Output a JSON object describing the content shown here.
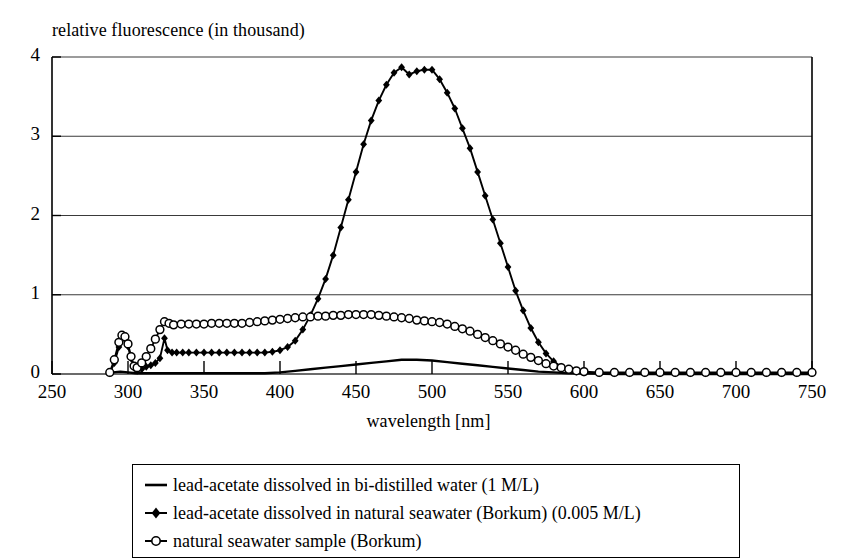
{
  "chart_data": {
    "type": "line",
    "title": "relative fluorescence (in thousand)",
    "xlabel": "wavelength [nm]",
    "ylabel": "relative fluorescence (in thousand)",
    "xlim": [
      250,
      750
    ],
    "ylim": [
      0,
      4
    ],
    "xticks": [
      250,
      300,
      350,
      400,
      450,
      500,
      550,
      600,
      650,
      700,
      750
    ],
    "yticks": [
      0,
      1,
      2,
      3,
      4
    ],
    "grid": "horizontal",
    "legend_position": "below-plot",
    "series": [
      {
        "name": "lead-acetate dissolved in bi-distilled water (1 M/L)",
        "marker": "none",
        "color": "#000000",
        "x": [
          290,
          295,
          300,
          305,
          310,
          320,
          330,
          340,
          350,
          360,
          370,
          380,
          390,
          400,
          410,
          420,
          430,
          440,
          450,
          460,
          470,
          480,
          490,
          500,
          510,
          520,
          530,
          540,
          550,
          560,
          570,
          580,
          590,
          600,
          620,
          640,
          660,
          680,
          700,
          720,
          740,
          750
        ],
        "y": [
          0.02,
          0.03,
          0.02,
          0.01,
          0.01,
          0.01,
          0.01,
          0.01,
          0.01,
          0.01,
          0.01,
          0.01,
          0.01,
          0.02,
          0.04,
          0.06,
          0.08,
          0.1,
          0.12,
          0.14,
          0.16,
          0.18,
          0.18,
          0.17,
          0.15,
          0.13,
          0.11,
          0.09,
          0.07,
          0.05,
          0.03,
          0.02,
          0.01,
          0.01,
          0.0,
          0.0,
          0.0,
          0.0,
          0.0,
          0.0,
          0.0,
          0.0
        ]
      },
      {
        "name": "lead-acetate dissolved in natural seawater (Borkum) (0.005 M/L)",
        "marker": "diamond",
        "color": "#000000",
        "x": [
          288,
          291,
          294,
          296,
          298,
          300,
          302,
          304,
          306,
          309,
          312,
          315,
          318,
          321,
          324,
          326,
          329,
          332,
          336,
          340,
          345,
          350,
          355,
          360,
          365,
          370,
          375,
          380,
          385,
          390,
          395,
          400,
          405,
          410,
          415,
          420,
          425,
          430,
          435,
          440,
          445,
          450,
          455,
          460,
          465,
          470,
          475,
          480,
          485,
          490,
          495,
          500,
          505,
          510,
          515,
          520,
          525,
          530,
          535,
          540,
          545,
          550,
          555,
          560,
          565,
          570,
          575,
          580,
          585,
          590,
          595,
          600,
          610,
          620,
          630,
          640,
          650,
          660,
          670,
          680,
          690,
          700,
          710,
          720,
          730,
          740,
          750
        ],
        "y": [
          0.01,
          0.14,
          0.34,
          0.45,
          0.44,
          0.35,
          0.2,
          0.08,
          0.04,
          0.06,
          0.09,
          0.11,
          0.14,
          0.2,
          0.45,
          0.3,
          0.27,
          0.27,
          0.27,
          0.27,
          0.27,
          0.27,
          0.27,
          0.27,
          0.27,
          0.27,
          0.27,
          0.27,
          0.27,
          0.27,
          0.28,
          0.3,
          0.34,
          0.42,
          0.56,
          0.74,
          0.95,
          1.2,
          1.5,
          1.85,
          2.2,
          2.55,
          2.9,
          3.2,
          3.45,
          3.65,
          3.8,
          3.87,
          3.78,
          3.82,
          3.84,
          3.84,
          3.72,
          3.55,
          3.35,
          3.1,
          2.85,
          2.55,
          2.25,
          1.95,
          1.65,
          1.35,
          1.05,
          0.8,
          0.58,
          0.4,
          0.26,
          0.16,
          0.09,
          0.05,
          0.03,
          0.02,
          0.01,
          0.01,
          0.01,
          0.01,
          0.01,
          0.01,
          0.01,
          0.01,
          0.01,
          0.01,
          0.01,
          0.01,
          0.01,
          0.01,
          0.01
        ]
      },
      {
        "name": "natural seawater sample (Borkum)",
        "marker": "circle",
        "color": "#000000",
        "x": [
          288,
          291,
          294,
          296,
          298,
          300,
          302,
          304,
          306,
          309,
          312,
          315,
          318,
          321,
          324,
          327,
          330,
          335,
          340,
          345,
          350,
          355,
          360,
          365,
          370,
          375,
          380,
          385,
          390,
          395,
          400,
          405,
          410,
          415,
          420,
          425,
          430,
          435,
          440,
          445,
          450,
          455,
          460,
          465,
          470,
          475,
          480,
          485,
          490,
          495,
          500,
          505,
          510,
          515,
          520,
          525,
          530,
          535,
          540,
          545,
          550,
          555,
          560,
          565,
          570,
          575,
          580,
          585,
          590,
          595,
          600,
          610,
          620,
          630,
          640,
          650,
          660,
          670,
          680,
          690,
          700,
          710,
          720,
          730,
          740,
          750
        ],
        "y": [
          0.02,
          0.18,
          0.4,
          0.49,
          0.47,
          0.38,
          0.22,
          0.1,
          0.08,
          0.14,
          0.22,
          0.32,
          0.44,
          0.56,
          0.66,
          0.64,
          0.62,
          0.63,
          0.63,
          0.63,
          0.63,
          0.64,
          0.64,
          0.64,
          0.64,
          0.64,
          0.65,
          0.66,
          0.67,
          0.68,
          0.69,
          0.7,
          0.71,
          0.72,
          0.72,
          0.73,
          0.73,
          0.74,
          0.74,
          0.75,
          0.75,
          0.75,
          0.75,
          0.74,
          0.73,
          0.72,
          0.71,
          0.7,
          0.68,
          0.67,
          0.66,
          0.65,
          0.63,
          0.6,
          0.57,
          0.54,
          0.5,
          0.46,
          0.42,
          0.38,
          0.34,
          0.3,
          0.25,
          0.21,
          0.17,
          0.13,
          0.1,
          0.08,
          0.06,
          0.04,
          0.03,
          0.02,
          0.02,
          0.02,
          0.02,
          0.02,
          0.02,
          0.02,
          0.02,
          0.02,
          0.02,
          0.02,
          0.02,
          0.02,
          0.02,
          0.02
        ]
      }
    ]
  },
  "legend": {
    "entries": [
      {
        "label": "lead-acetate dissolved in bi-distilled water (1 M/L)",
        "marker": "none"
      },
      {
        "label": "lead-acetate dissolved in natural seawater (Borkum) (0.005 M/L)",
        "marker": "diamond"
      },
      {
        "label": "natural seawater sample (Borkum)",
        "marker": "circle"
      }
    ]
  },
  "colors": {
    "ink": "#000000",
    "grid": "#3a3a3a",
    "background": "#ffffff"
  }
}
